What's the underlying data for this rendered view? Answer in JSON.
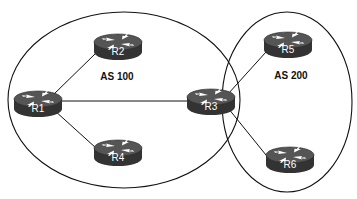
{
  "diagram": {
    "type": "network-topology",
    "colors": {
      "background": "#ffffff",
      "line": "#111111",
      "router_body": "#3a3a3a",
      "router_top": "#5a5a5a",
      "router_arrows": "#ffffff",
      "router_label": "#ffffff"
    },
    "autonomous_systems": [
      {
        "id": "as100",
        "label": "AS 100",
        "cx": 124,
        "cy": 100,
        "rx": 116,
        "ry": 88,
        "label_x": 117,
        "label_y": 80
      },
      {
        "id": "as200",
        "label": "AS 200",
        "cx": 287,
        "cy": 102,
        "rx": 65,
        "ry": 90,
        "label_x": 291,
        "label_y": 79
      }
    ],
    "routers": [
      {
        "id": "R1",
        "label": "R1",
        "x": 38,
        "y": 103,
        "as": "AS 100"
      },
      {
        "id": "R2",
        "label": "R2",
        "x": 118,
        "y": 46,
        "as": "AS 100"
      },
      {
        "id": "R3",
        "label": "R3",
        "x": 211,
        "y": 101,
        "as": "AS 100 / AS 200"
      },
      {
        "id": "R4",
        "label": "R4",
        "x": 118,
        "y": 152,
        "as": "AS 100"
      },
      {
        "id": "R5",
        "label": "R5",
        "x": 288,
        "y": 44,
        "as": "AS 200"
      },
      {
        "id": "R6",
        "label": "R6",
        "x": 290,
        "y": 159,
        "as": "AS 200"
      }
    ],
    "links": [
      {
        "from": "R1",
        "to": "R2"
      },
      {
        "from": "R1",
        "to": "R3"
      },
      {
        "from": "R1",
        "to": "R4"
      },
      {
        "from": "R3",
        "to": "R5"
      },
      {
        "from": "R3",
        "to": "R6"
      }
    ]
  }
}
